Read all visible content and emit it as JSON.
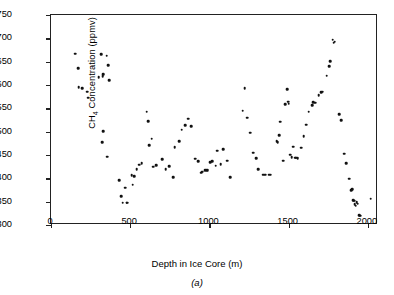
{
  "chart_data": {
    "type": "scatter",
    "title": "",
    "xlabel": "Depth in Ice Core (m)",
    "ylabel": "CH4 Concentration (ppmv)",
    "ylabel_prefix": "CH",
    "ylabel_sub": "4",
    "ylabel_suffix": " Concentration (ppmv)",
    "caption": "(a)",
    "xlim": [
      0,
      2064
    ],
    "ylim": [
      300,
      750
    ],
    "xticks": [
      0,
      500,
      1000,
      1500,
      2000
    ],
    "yticks": [
      300,
      350,
      400,
      450,
      500,
      550,
      600,
      650,
      700,
      750
    ],
    "grid": false,
    "legend": null,
    "marker": "filled-circle",
    "marker_color": "#111111",
    "frame_color": "#222222",
    "background": "#ffffff",
    "series": [
      {
        "name": "CH4 concentration vs depth",
        "points": [
          [
            152,
            667
          ],
          [
            170,
            636
          ],
          [
            176,
            595
          ],
          [
            196,
            593
          ],
          [
            228,
            586
          ],
          [
            236,
            573
          ],
          [
            300,
            617
          ],
          [
            318,
            666
          ],
          [
            326,
            619
          ],
          [
            330,
            623
          ],
          [
            352,
            663
          ],
          [
            360,
            642
          ],
          [
            366,
            610
          ],
          [
            330,
            501
          ],
          [
            322,
            477
          ],
          [
            356,
            446
          ],
          [
            430,
            396
          ],
          [
            442,
            362
          ],
          [
            452,
            348
          ],
          [
            470,
            380
          ],
          [
            478,
            348
          ],
          [
            482,
            348
          ],
          [
            510,
            407
          ],
          [
            516,
            386
          ],
          [
            524,
            404
          ],
          [
            540,
            420
          ],
          [
            556,
            429
          ],
          [
            572,
            433
          ],
          [
            604,
            543
          ],
          [
            614,
            523
          ],
          [
            620,
            471
          ],
          [
            636,
            485
          ],
          [
            646,
            425
          ],
          [
            664,
            428
          ],
          [
            702,
            441
          ],
          [
            724,
            420
          ],
          [
            746,
            426
          ],
          [
            770,
            403
          ],
          [
            780,
            467
          ],
          [
            808,
            480
          ],
          [
            824,
            504
          ],
          [
            848,
            514
          ],
          [
            866,
            528
          ],
          [
            884,
            512
          ],
          [
            910,
            442
          ],
          [
            930,
            437
          ],
          [
            948,
            412
          ],
          [
            956,
            414
          ],
          [
            974,
            417
          ],
          [
            984,
            418
          ],
          [
            990,
            418
          ],
          [
            1006,
            434
          ],
          [
            1018,
            437
          ],
          [
            1040,
            427
          ],
          [
            1048,
            459
          ],
          [
            1070,
            430
          ],
          [
            1086,
            462
          ],
          [
            1114,
            438
          ],
          [
            1130,
            403
          ],
          [
            1210,
            545
          ],
          [
            1222,
            593
          ],
          [
            1240,
            530
          ],
          [
            1256,
            498
          ],
          [
            1278,
            455
          ],
          [
            1296,
            443
          ],
          [
            1306,
            420
          ],
          [
            1340,
            408
          ],
          [
            1352,
            408
          ],
          [
            1376,
            408
          ],
          [
            1386,
            408
          ],
          [
            1424,
            479
          ],
          [
            1432,
            478
          ],
          [
            1440,
            493
          ],
          [
            1448,
            521
          ],
          [
            1466,
            438
          ],
          [
            1478,
            559
          ],
          [
            1490,
            591
          ],
          [
            1496,
            564
          ],
          [
            1500,
            560
          ],
          [
            1510,
            451
          ],
          [
            1520,
            445
          ],
          [
            1530,
            468
          ],
          [
            1540,
            444
          ],
          [
            1548,
            444
          ],
          [
            1556,
            443
          ],
          [
            1578,
            466
          ],
          [
            1594,
            490
          ],
          [
            1612,
            515
          ],
          [
            1626,
            543
          ],
          [
            1648,
            557
          ],
          [
            1656,
            563
          ],
          [
            1668,
            562
          ],
          [
            1690,
            578
          ],
          [
            1706,
            585
          ],
          [
            1716,
            586
          ],
          [
            1740,
            620
          ],
          [
            1756,
            640
          ],
          [
            1762,
            651
          ],
          [
            1778,
            697
          ],
          [
            1784,
            691
          ],
          [
            1790,
            693
          ],
          [
            1820,
            537
          ],
          [
            1832,
            525
          ],
          [
            1852,
            453
          ],
          [
            1862,
            433
          ],
          [
            1884,
            399
          ],
          [
            1896,
            375
          ],
          [
            1900,
            377
          ],
          [
            1906,
            353
          ],
          [
            1912,
            352
          ],
          [
            1918,
            345
          ],
          [
            1924,
            341
          ],
          [
            1930,
            349
          ],
          [
            1936,
            346
          ],
          [
            1946,
            321
          ],
          [
            1950,
            320
          ],
          [
            2018,
            356
          ]
        ]
      }
    ]
  }
}
